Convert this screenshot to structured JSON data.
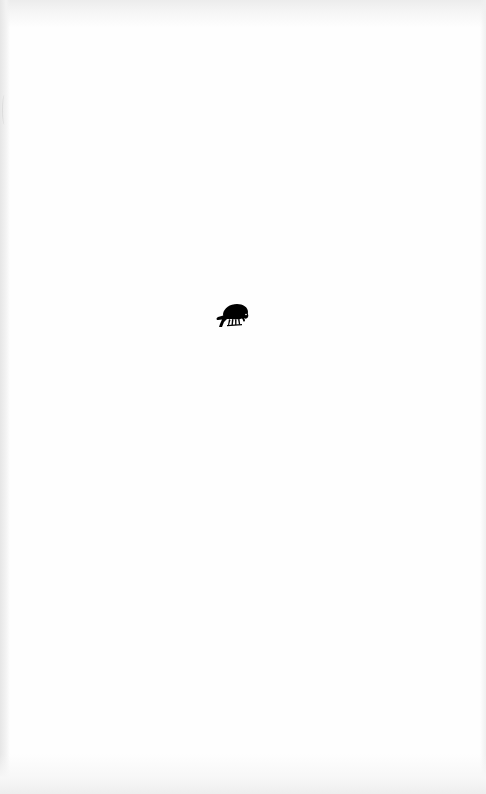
{
  "page": {
    "type": "blank-book-page",
    "background_color": "#fefefe",
    "ornament": {
      "icon": "crow-ornament-icon",
      "description": "printer's device: black bird perched, head lowered",
      "color": "#000000"
    }
  }
}
